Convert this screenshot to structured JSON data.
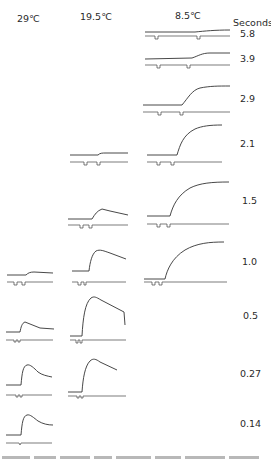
{
  "figure": {
    "columns": [
      {
        "id": "col-29",
        "label": "29℃",
        "x": 17
      },
      {
        "id": "col-19-5",
        "label": "19.5℃",
        "x": 80
      },
      {
        "id": "col-8-5",
        "label": "8.5℃",
        "x": 175
      }
    ],
    "row_axis_label": "Seconds",
    "rows": [
      {
        "label": "5.8",
        "y": 34
      },
      {
        "label": "3.9",
        "y": 58
      },
      {
        "label": "2.9",
        "y": 99
      },
      {
        "label": "2.1",
        "y": 144
      },
      {
        "label": "1.5",
        "y": 201
      },
      {
        "label": "1.0",
        "y": 262
      },
      {
        "label": "0.5",
        "y": 316
      },
      {
        "label": "0.27",
        "y": 374
      },
      {
        "label": "0.14",
        "y": 424
      }
    ],
    "traces": [
      {
        "column": "8.5℃",
        "interval_s": "5.8",
        "response": "very slight late rise",
        "path": "M145,32 L195,32 C205,31 215,30 230,30",
        "stim": "M145,36 L155,36 L155,39 L158,39 L158,36 L197,36 L197,39 L200,39 L200,36 L230,36"
      },
      {
        "column": "8.5℃",
        "interval_s": "3.9",
        "response": "small rise after 2nd pulse",
        "path": "M145,59 L192,58 C198,56 202,53 210,53 L230,53",
        "stim": "M145,65 L157,65 L157,68 L160,68 L160,65 L187,65 L187,68 L190,68 L190,65 L230,65"
      },
      {
        "column": "8.5℃",
        "interval_s": "2.9",
        "response": "moderate sigmoid rise",
        "path": "M143,105 L182,105 C188,98 192,90 200,88 C210,86 218,86 230,86",
        "stim": "M143,112 L158,112 L158,115 L161,115 L161,112 L180,112 L180,115 L183,115 L183,112 L230,112"
      },
      {
        "column": "8.5℃",
        "interval_s": "2.1",
        "response": "large rise to plateau",
        "path": "M147,155 L177,155 C180,145 183,135 195,129 C202,126 210,125 222,125",
        "stim": "M147,162 L157,162 L157,165 L160,165 L160,162 L171,162 L171,165 L174,165 L174,162 L222,162"
      },
      {
        "column": "8.5℃",
        "interval_s": "1.5",
        "response": "large rise to plateau",
        "path": "M147,216 L170,216 C173,205 178,195 190,188 C200,183 212,182 229,182",
        "stim": "M147,224 L157,224 L157,227 L160,227 L160,224 L167,224 L167,227 L170,227 L170,224 L229,224"
      },
      {
        "column": "8.5℃",
        "interval_s": "1.0",
        "response": "large rise to plateau",
        "path": "M144,279 L165,279 C167,270 172,258 185,250 C197,243 210,242 224,242",
        "stim": "M144,282 L152,282 L152,285 L155,285 L155,282 L159,282 L159,285 L162,285 L162,282 L227,282"
      },
      {
        "column": "19.5℃",
        "interval_s": "2.1",
        "response": "barely perceptible step",
        "path": "M70,155 L98,155 C100,153 102,153 106,153 L128,153",
        "stim": "M70,162 L84,162 L84,165 L87,165 L87,162 L97,162 L97,165 L100,165 L100,162 L128,162"
      },
      {
        "column": "19.5℃",
        "interval_s": "1.5",
        "response": "small hump with slow decay",
        "path": "M68,219 L92,219 C95,214 97,211 102,209 L110,211 L128,215",
        "stim": "M68,225 L80,225 L80,228 L83,228 L83,225 L89,225 L89,228 L92,228 L92,225 L128,225"
      },
      {
        "column": "19.5℃",
        "interval_s": "1.0",
        "response": "fast rise, sloped decay",
        "path": "M72,271 L89,271 C90,262 92,254 96,251 C100,249 104,251 110,253 L126,259",
        "stim": "M72,282 L78,282 L78,285 L81,285 L81,282 L84,282 L84,285 L86,285 L86,282 L126,282"
      },
      {
        "column": "19.5℃",
        "interval_s": "0.5",
        "response": "tall fast peak, linear decay, sharp drop",
        "path": "M70,336 L82,336 C83,318 85,303 91,298 C94,296 96,297 101,300 L124,312 L125,325",
        "stim": "M70,340 L76,340 L76,343 L78,343 L78,340 L80,340 L80,343 L82,343 L82,340 L126,340"
      },
      {
        "column": "19.5℃",
        "interval_s": "0.27",
        "response": "tall peak with decay",
        "path": "M68,392 L82,392 C83,378 85,366 90,361 C93,358 96,359 100,362 L117,370",
        "stim": "M68,396 L77,396 L77,398 L79,398 L79,396 L81,396 L81,398 L83,398 L83,396 L126,396"
      },
      {
        "column": "29℃",
        "interval_s": "1.0",
        "response": "small step",
        "path": "M7,275 L26,275 C28,273 30,272 34,272 L53,273",
        "stim": "M7,282 L14,282 L14,285 L17,285 L17,282 L22,282 L22,285 L25,285 L25,282 L53,282"
      },
      {
        "column": "29℃",
        "interval_s": "0.5",
        "response": "small peak with decay",
        "path": "M6,332 L20,332 C21,327 22,323 25,322 L30,324 L40,328 L54,329",
        "stim": "M6,340 L14,340 L14,342 L16,342 L16,340 L18,340 L18,342 L20,342 L20,340 L53,340"
      },
      {
        "column": "29℃",
        "interval_s": "0.27",
        "response": "fast peak with exponential decay",
        "path": "M6,385 L21,385 C22,373 23,366 27,365 C30,364 34,368 38,372 C42,375 47,376 52,377",
        "stim": "M6,395 L16,395 L16,397 L18,397 L18,395 L20,395 L20,397 L22,397 L22,395 L52,395"
      },
      {
        "column": "29℃",
        "interval_s": "0.14",
        "response": "fast peak with exponential decay",
        "path": "M6,435 L21,435 C22,423 23,416 27,415 C30,414 34,418 38,421 C43,424 48,425 53,425",
        "stim": "M6,443 L19,443 L20,445 L21,443 L52,443"
      }
    ],
    "caption_partial": "caption text cut off at bottom edge (illegible)"
  }
}
